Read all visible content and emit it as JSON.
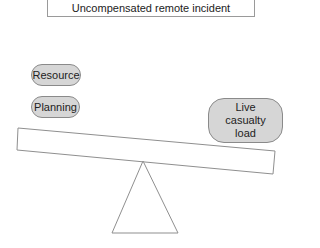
{
  "title": "Uncompensated remote incident",
  "left_items": [
    {
      "label": "Resource"
    },
    {
      "label": "Planning"
    }
  ],
  "right_items": [
    {
      "label_lines": [
        "Live",
        "casualty",
        "load"
      ]
    }
  ],
  "colors": {
    "pill_fill": "#d6d6d6",
    "pill_border": "#8a8a8a",
    "line": "#8f8f8f"
  }
}
